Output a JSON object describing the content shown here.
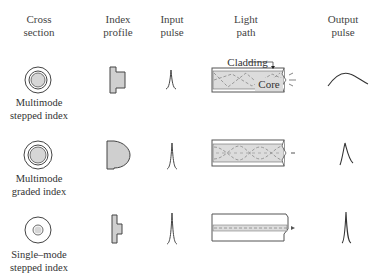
{
  "headers": {
    "cross_section": [
      "Cross",
      "section"
    ],
    "index_profile": [
      "Index",
      "profile"
    ],
    "input_pulse": [
      "Input",
      "pulse"
    ],
    "light_path": [
      "Light",
      "path"
    ],
    "output_pulse": [
      "Output",
      "pulse"
    ]
  },
  "rows": [
    {
      "name": [
        "Multimode",
        "stepped index"
      ],
      "cladding_label": "Cladding",
      "core_label": "Core"
    },
    {
      "name": [
        "Multimode",
        "graded index"
      ]
    },
    {
      "name": [
        "Single–mode",
        "stepped index"
      ]
    }
  ],
  "colors": {
    "stroke": "#444444",
    "fill_gray": "#cfcfcf",
    "fill_core": "#d8d8d8"
  }
}
